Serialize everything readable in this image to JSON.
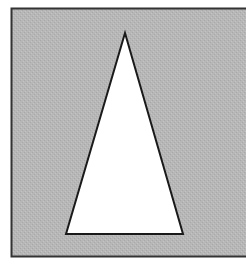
{
  "figure": {
    "colors": {
      "page_background": "#ffffff",
      "box_fill": "#b4b4b4",
      "box_stroke": "#333333",
      "triangle_fill": "#ffffff",
      "triangle_stroke": "#1a1a1a"
    },
    "box": {
      "x": 11,
      "y": 8,
      "width": 240,
      "height": 248
    },
    "triangle": {
      "apex": [
        125,
        33
      ],
      "base_left": [
        66,
        234
      ],
      "base_right": [
        183,
        234
      ]
    }
  }
}
